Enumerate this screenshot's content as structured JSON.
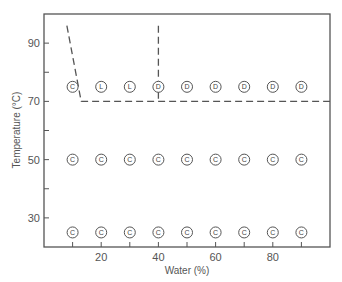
{
  "chart_data": {
    "type": "scatter",
    "title": "",
    "xlabel": "Water (%)",
    "ylabel": "Temperature (°C)",
    "xlim": [
      0,
      100
    ],
    "ylim": [
      20,
      100
    ],
    "x_ticks": [
      10,
      20,
      30,
      40,
      50,
      60,
      70,
      80,
      90
    ],
    "x_tick_labels": [
      "",
      "20",
      "",
      "40",
      "",
      "60",
      "",
      "80",
      ""
    ],
    "y_ticks": [
      30,
      40,
      50,
      60,
      70,
      80,
      90
    ],
    "y_tick_labels": [
      "30",
      "",
      "50",
      "",
      "70",
      "",
      "90"
    ],
    "grid": false,
    "legend": null,
    "marker_style": "circled letter",
    "series": [
      {
        "name": "T=75",
        "y": 75,
        "x": [
          10,
          20,
          30,
          40,
          50,
          60,
          70,
          80,
          90
        ],
        "labels": [
          "C",
          "L",
          "L",
          "D",
          "D",
          "D",
          "D",
          "D",
          "D"
        ]
      },
      {
        "name": "T=50",
        "y": 50,
        "x": [
          10,
          20,
          30,
          40,
          50,
          60,
          70,
          80,
          90
        ],
        "labels": [
          "C",
          "C",
          "C",
          "C",
          "C",
          "C",
          "C",
          "C",
          "C"
        ]
      },
      {
        "name": "T=25",
        "y": 25,
        "x": [
          10,
          20,
          30,
          40,
          50,
          60,
          70,
          80,
          90
        ],
        "labels": [
          "C",
          "C",
          "C",
          "C",
          "C",
          "C",
          "C",
          "C",
          "C"
        ]
      }
    ],
    "boundaries": [
      {
        "name": "C-boundary",
        "style": "dashed",
        "points": [
          [
            8,
            96
          ],
          [
            13,
            70
          ],
          [
            100,
            70
          ]
        ]
      },
      {
        "name": "L-D-boundary",
        "style": "dashed",
        "points": [
          [
            40,
            96
          ],
          [
            40,
            70
          ]
        ]
      }
    ],
    "annotations": []
  }
}
